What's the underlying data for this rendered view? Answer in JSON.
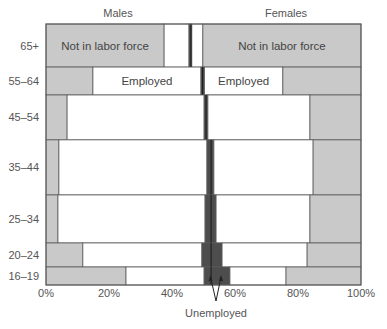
{
  "chart_data": {
    "type": "mosaic",
    "title": "",
    "xlabel": "",
    "ylabel": "",
    "xlim": [
      0,
      100
    ],
    "x_unit": "%",
    "x_ticks": [
      "0%",
      "20%",
      "40%",
      "60%",
      "80%",
      "100%"
    ],
    "x_tick_values": [
      0,
      20,
      40,
      60,
      80,
      100
    ],
    "group_headers": {
      "left": "Males",
      "right": "Females"
    },
    "annotation": "Unemployed",
    "colors": {
      "not_in_labor_force": "#c9c9c9",
      "employed": "#ffffff",
      "unemployed": "#4d4d4d",
      "border": "#5a5a5a",
      "divider": "#1e1e1e"
    },
    "segment_order": [
      "male_not_in_labor_force",
      "male_employed",
      "male_unemployed",
      "female_unemployed",
      "female_employed",
      "female_not_in_labor_force"
    ],
    "rows": [
      {
        "age": "65+",
        "population_share": 16.5,
        "cum_boundaries": [
          0,
          37.5,
          45.4,
          46.0,
          46.3,
          49.8,
          100
        ],
        "labels": {
          "male_not_in_labor_force": "Not in labor force",
          "female_not_in_labor_force": "Not in labor force"
        }
      },
      {
        "age": "55–64",
        "population_share": 10.7,
        "cum_boundaries": [
          0,
          14.9,
          49.2,
          49.7,
          50.3,
          75.2,
          100
        ],
        "labels": {
          "male_employed": "Employed",
          "female_employed": "Employed"
        }
      },
      {
        "age": "45–54",
        "population_share": 17.2,
        "cum_boundaries": [
          0,
          6.7,
          50.2,
          50.8,
          51.4,
          83.8,
          100
        ],
        "labels": {}
      },
      {
        "age": "35–44",
        "population_share": 21.1,
        "cum_boundaries": [
          0,
          4.1,
          51.1,
          52.4,
          53.3,
          84.8,
          100
        ],
        "labels": {}
      },
      {
        "age": "25–34",
        "population_share": 18.4,
        "cum_boundaries": [
          0,
          3.8,
          50.5,
          52.4,
          54.0,
          83.8,
          100
        ],
        "labels": {}
      },
      {
        "age": "20–24",
        "population_share": 9.2,
        "cum_boundaries": [
          0,
          11.7,
          49.5,
          52.4,
          55.9,
          82.9,
          100
        ],
        "labels": {}
      },
      {
        "age": "16–19",
        "population_share": 6.9,
        "cum_boundaries": [
          0,
          25.4,
          50.2,
          52.4,
          58.4,
          76.2,
          100
        ],
        "labels": {}
      }
    ]
  }
}
